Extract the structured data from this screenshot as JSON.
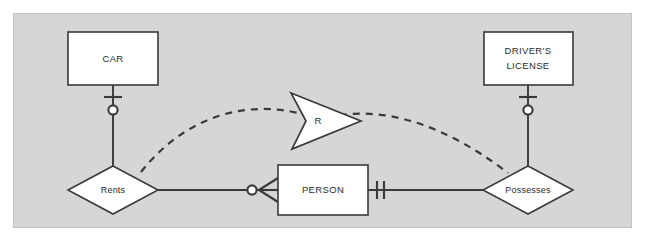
{
  "diagram": {
    "background_color": "#d6d6d6",
    "page_color": "#ffffff",
    "shape_fill": "#ffffff",
    "line_color": "#3a3a3a",
    "text_color": "#2b2b2b",
    "entities": [
      {
        "id": "car",
        "label": "CAR",
        "x": 68,
        "y": 32,
        "w": 90,
        "h": 53
      },
      {
        "id": "drivers_license",
        "label": "DRIVER'S\nLICENSE",
        "line1": "DRIVER'S",
        "line2": "LICENSE",
        "x": 484,
        "y": 32,
        "w": 89,
        "h": 53
      },
      {
        "id": "person",
        "label": "PERSON",
        "x": 278,
        "y": 165,
        "w": 90,
        "h": 50
      }
    ],
    "relationships": [
      {
        "id": "rents",
        "label": "Rents",
        "cx": 113,
        "cy": 190,
        "rx": 45,
        "ry": 24
      },
      {
        "id": "possesses",
        "label": "Possesses",
        "cx": 528,
        "cy": 190,
        "rx": 45,
        "ry": 24
      }
    ],
    "annotations": [
      {
        "id": "r_arrow",
        "label": "R",
        "cx": 330,
        "cy": 120,
        "shape": "chevron-arrow-right"
      }
    ],
    "connectors": [
      {
        "id": "car-rents",
        "from": "car",
        "to": "rents",
        "style": "solid",
        "notation_near_car": "one-and-only-one-optional"
      },
      {
        "id": "rents-person",
        "from": "rents",
        "to": "person",
        "style": "solid",
        "notation_near_person": "zero-or-many"
      },
      {
        "id": "person-possesses",
        "from": "person",
        "to": "possesses",
        "style": "solid",
        "notation_near_person": "one-and-only-one"
      },
      {
        "id": "license-possesses",
        "from": "drivers_license",
        "to": "possesses",
        "style": "solid",
        "notation_near_license": "one-and-only-one-optional"
      },
      {
        "id": "rents-possesses-dashed",
        "from": "rents",
        "to": "possesses",
        "style": "dashed",
        "label": "R"
      }
    ],
    "cardinality_symbols": {
      "zero_or_many": "circle + crow's foot",
      "exactly_one": "double tick",
      "zero_or_one": "tick + circle"
    }
  }
}
